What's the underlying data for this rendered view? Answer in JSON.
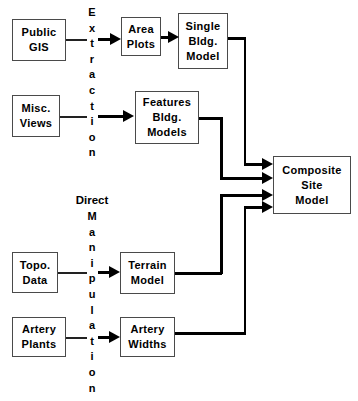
{
  "diagram": {
    "background": "#ffffff",
    "line_color": "#000000",
    "box_border": "#4a4a4a",
    "text_color": "#000000"
  },
  "nodes": {
    "public_gis": {
      "line1": "Public",
      "line2": "GIS"
    },
    "misc_views": {
      "line1": "Misc.",
      "line2": "Views"
    },
    "area_plots": {
      "line1": "Area",
      "line2": "Plots"
    },
    "single_bldg_model": {
      "line1": "Single",
      "line2": "Bldg.",
      "line3": "Model"
    },
    "features_bldg_models": {
      "line1": "Features",
      "line2": "Bldg.",
      "line3": "Models"
    },
    "topo_data": {
      "line1": "Topo.",
      "line2": "Data"
    },
    "artery_plants": {
      "line1": "Artery",
      "line2": "Plants"
    },
    "terrain_model": {
      "line1": "Terrain",
      "line2": "Model"
    },
    "artery_widths": {
      "line1": "Artery",
      "line2": "Widths"
    },
    "composite_site_model": {
      "line1": "Composite",
      "line2": "Site",
      "line3": "Model"
    }
  },
  "process_labels": {
    "extraction": {
      "text": "Extraction",
      "letters": [
        "E",
        "x",
        "t",
        "r",
        "a",
        "c",
        "t",
        "i",
        "o",
        "n"
      ]
    },
    "direct": {
      "text": "Direct"
    },
    "manipulation": {
      "text": "Manipulation",
      "letters": [
        "M",
        "a",
        "n",
        "i",
        "p",
        "u",
        "l",
        "a",
        "t",
        "i",
        "o",
        "n"
      ]
    }
  },
  "edges": [
    {
      "from": "public_gis",
      "to": "area_plots",
      "via": "extraction"
    },
    {
      "from": "misc_views",
      "to": "features_bldg_models",
      "via": "extraction"
    },
    {
      "from": "area_plots",
      "to": "single_bldg_model",
      "via": ""
    },
    {
      "from": "single_bldg_model",
      "to": "composite_site_model",
      "via": ""
    },
    {
      "from": "features_bldg_models",
      "to": "composite_site_model",
      "via": ""
    },
    {
      "from": "topo_data",
      "to": "terrain_model",
      "via": "manipulation"
    },
    {
      "from": "artery_plants",
      "to": "artery_widths",
      "via": "manipulation"
    },
    {
      "from": "terrain_model",
      "to": "composite_site_model",
      "via": ""
    },
    {
      "from": "artery_widths",
      "to": "composite_site_model",
      "via": ""
    }
  ]
}
